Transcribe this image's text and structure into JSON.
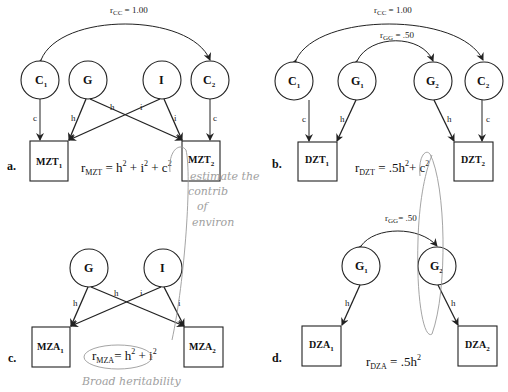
{
  "panels": {
    "a": {
      "label": "a.",
      "correlation_cc": {
        "r": "r",
        "sub": "CC",
        "value": " = 1.00"
      },
      "nodes": {
        "c1": {
          "main": "C",
          "sub": "1"
        },
        "g": {
          "main": "G"
        },
        "i": {
          "main": "I"
        },
        "c2": {
          "main": "C",
          "sub": "2"
        }
      },
      "boxes": {
        "t1": {
          "main": "MZT",
          "sub": "1"
        },
        "t2": {
          "main": "MZT",
          "sub": "2"
        }
      },
      "paths": {
        "c_left": "c",
        "h_left": "h",
        "h_cross": "h",
        "i_cross": "i",
        "i_right": "i",
        "c_right": "c"
      },
      "equation": {
        "r": "r",
        "sub": "MZT",
        "eq": " = h",
        "sup1": "2",
        "p1": " + i",
        "sup2": "2",
        "p2": " + c",
        "sup3": "2"
      }
    },
    "b": {
      "label": "b.",
      "correlation_cc": {
        "r": "r",
        "sub": "CC",
        "value": " = 1.00"
      },
      "correlation_gg": {
        "r": "r",
        "sub": "GG",
        "value": " = .50"
      },
      "nodes": {
        "c1": {
          "main": "C",
          "sub": "1"
        },
        "g1": {
          "main": "G",
          "sub": "1"
        },
        "g2": {
          "main": "G",
          "sub": "2"
        },
        "c2": {
          "main": "C",
          "sub": "2"
        }
      },
      "boxes": {
        "t1": {
          "main": "DZT",
          "sub": "1"
        },
        "t2": {
          "main": "DZT",
          "sub": "2"
        }
      },
      "paths": {
        "c_left": "c",
        "h_left": "h",
        "h_right": "h",
        "c_right": "c"
      },
      "equation": {
        "r": "r",
        "sub": "DZT",
        "eq": " = .5h",
        "sup1": "2",
        "p1": "+ c",
        "sup2": "2"
      }
    },
    "c": {
      "label": "c.",
      "nodes": {
        "g": {
          "main": "G"
        },
        "i": {
          "main": "I"
        }
      },
      "boxes": {
        "t1": {
          "main": "MZA",
          "sub": "1"
        },
        "t2": {
          "main": "MZA",
          "sub": "2"
        }
      },
      "paths": {
        "h_left": "h",
        "h_cross": "h",
        "i_cross": "i",
        "i_right": "i"
      },
      "equation": {
        "r": "r",
        "sub": "MZA",
        "eq": "= h",
        "sup1": "2",
        "p1": " + i",
        "sup2": "2"
      }
    },
    "d": {
      "label": "d.",
      "correlation_gg": {
        "r": "r",
        "sub": "GG",
        "value": "= .50"
      },
      "nodes": {
        "g1": {
          "main": "G",
          "sub": "1"
        },
        "g2": {
          "main": "G",
          "sub": "2"
        }
      },
      "boxes": {
        "t1": {
          "main": "DZA",
          "sub": "1"
        },
        "t2": {
          "main": "DZA",
          "sub": "2"
        }
      },
      "paths": {
        "h_left": "h",
        "h_right": "h"
      },
      "equation": {
        "r": "r",
        "sub": "DZA",
        "eq": " = .5h",
        "sup1": "2"
      }
    }
  },
  "handwritten_notes": {
    "note1_line1": "estimate the",
    "note1_line2": "contrib",
    "note1_line3": "of",
    "note1_line4": "environ",
    "note2": "Broad heritability"
  }
}
